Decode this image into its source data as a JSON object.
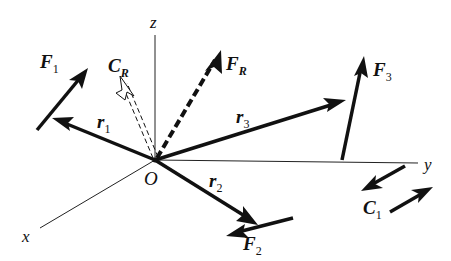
{
  "diagram": {
    "origin": {
      "label": "O",
      "x": 155,
      "y": 160
    },
    "axes": {
      "z": {
        "label": "z",
        "end": [
          155,
          35
        ]
      },
      "y": {
        "label": "y",
        "end": [
          418,
          163
        ]
      },
      "x": {
        "label": "x",
        "end": [
          40,
          228
        ]
      }
    },
    "position_vectors": [
      {
        "name": "r1",
        "base": "r",
        "sub": "1",
        "to": [
          52,
          118
        ]
      },
      {
        "name": "r2",
        "base": "r",
        "sub": "2",
        "to": [
          257,
          224
        ]
      },
      {
        "name": "r3",
        "base": "r",
        "sub": "3",
        "to": [
          345,
          100
        ]
      }
    ],
    "forces": [
      {
        "name": "F1",
        "base": "F",
        "sub": "1",
        "from": [
          37,
          130
        ],
        "to": [
          88,
          68
        ]
      },
      {
        "name": "F2",
        "base": "F",
        "sub": "2",
        "from": [
          293,
          218
        ],
        "to": [
          228,
          235
        ]
      },
      {
        "name": "F3",
        "base": "F",
        "sub": "3",
        "from": [
          342,
          160
        ],
        "to": [
          363,
          57
        ]
      }
    ],
    "resultant_force": {
      "name": "FR",
      "base": "F",
      "sub": "R",
      "style": "dashed",
      "to": [
        220,
        52
      ]
    },
    "resultant_couple": {
      "name": "CR",
      "base": "C",
      "sub": "R",
      "style": "double-dashed",
      "to": [
        120,
        78
      ]
    },
    "couple": {
      "name": "C1",
      "base": "C",
      "sub": "1",
      "arrows": [
        {
          "from": [
            405,
            166
          ],
          "to": [
            362,
            190
          ]
        },
        {
          "from": [
            390,
            212
          ],
          "to": [
            432,
            188
          ]
        }
      ]
    },
    "colors": {
      "ink": "#111111",
      "background": "#ffffff"
    }
  }
}
